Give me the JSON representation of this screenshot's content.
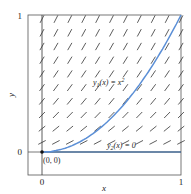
{
  "figure": {
    "type": "slope_field",
    "ode": "y' = 2 sqrt(y)",
    "xlabel": "x",
    "ylabel": "y",
    "x_ticks": [
      "0",
      "1"
    ],
    "y_ticks": [
      "0",
      "1"
    ],
    "xlim": [
      -0.1,
      1
    ],
    "ylim": [
      -0.17,
      1
    ],
    "colors": {
      "curve": "#5b8fd6",
      "axis_line": "#3a5f8a",
      "field": "#333333",
      "frame": "#555555"
    },
    "curves": [
      {
        "name": "y1",
        "label_prefix": "y",
        "label_sub": "1",
        "label_mid": "(x) = x",
        "label_sup": "2",
        "formula": "x^2"
      },
      {
        "name": "y2",
        "label_prefix": "y",
        "label_sub": "2",
        "label_mid": "(x) = 0",
        "formula": "0"
      }
    ],
    "point_label": "(0, 0)"
  }
}
